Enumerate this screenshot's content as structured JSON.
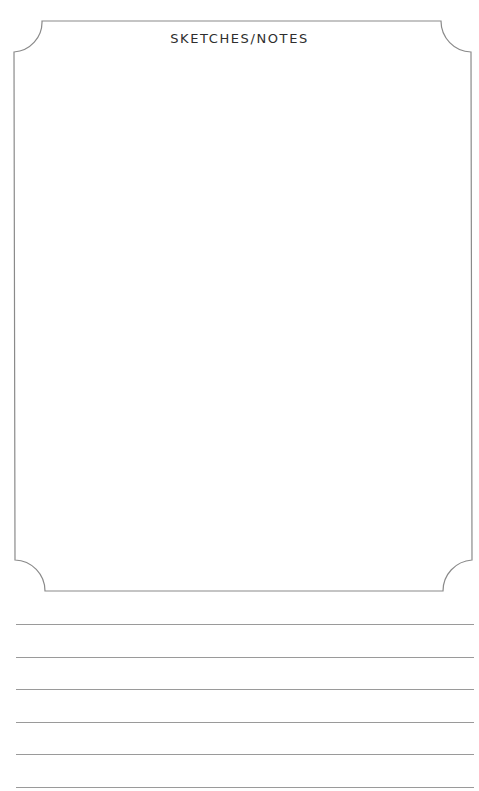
{
  "page": {
    "title": "SKETCHES/NOTES",
    "colors": {
      "border": "#8a8a8a",
      "title_text": "#2e2e2e",
      "rule_line": "#9a9a9a",
      "background": "#ffffff"
    },
    "sketch_box": {
      "content": ""
    },
    "ruled_lines": [
      {
        "index": 1,
        "text": ""
      },
      {
        "index": 2,
        "text": ""
      },
      {
        "index": 3,
        "text": ""
      },
      {
        "index": 4,
        "text": ""
      },
      {
        "index": 5,
        "text": ""
      },
      {
        "index": 6,
        "text": ""
      }
    ]
  }
}
